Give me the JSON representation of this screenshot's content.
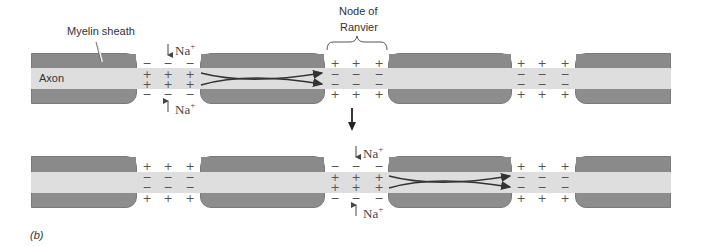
{
  "labels": {
    "myelin_sheath": "Myelin sheath",
    "axon": "Axon",
    "node_of_ranvier_line1": "Node of",
    "node_of_ranvier_line2": "Ranvier",
    "panel": "(b)"
  },
  "ions": {
    "top_upper": "Na",
    "top_lower": "Na",
    "bottom_upper": "Na",
    "bottom_lower": "Na",
    "charge_sup": "+"
  },
  "charges": {
    "plus": "+",
    "minus": "−"
  },
  "rows": [
    {
      "name": "before",
      "depolarized_node": 1,
      "nodes": [
        {
          "outer": "−",
          "inner": "+"
        },
        {
          "outer": "+",
          "inner": "−"
        },
        {
          "outer": "+",
          "inner": "−"
        }
      ]
    },
    {
      "name": "after",
      "depolarized_node": 2,
      "nodes": [
        {
          "outer": "+",
          "inner": "−"
        },
        {
          "outer": "−",
          "inner": "+"
        },
        {
          "outer": "+",
          "inner": "−"
        }
      ]
    }
  ],
  "colors": {
    "myelin": "#8d8d8d",
    "axon": "#dedede",
    "arrow": "#333333",
    "text": "#333333"
  }
}
